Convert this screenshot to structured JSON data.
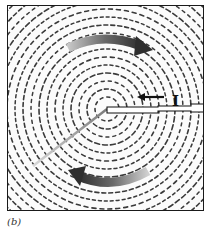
{
  "figure": {
    "current_label": "I",
    "caption": "(b)",
    "colors": {
      "frame": "#1a1a1a",
      "filings": "#3a3a3a",
      "field_arrow": "#5a5a5a",
      "background": "#fbfbfb"
    },
    "field_direction": "counterclockwise",
    "current_direction": "leftward"
  }
}
